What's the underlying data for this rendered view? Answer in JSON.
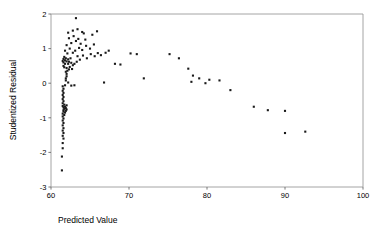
{
  "chart_data": {
    "type": "scatter",
    "title": "",
    "xlabel": "Predicted Value",
    "ylabel": "Studentized Residual",
    "xlim": [
      60,
      100
    ],
    "ylim": [
      -3,
      2
    ],
    "xticks": [
      60,
      70,
      80,
      90,
      100
    ],
    "xticklabels": [
      "60",
      "70",
      "80",
      "90",
      "100"
    ],
    "yticks": [
      -3,
      -2,
      -1,
      0,
      1,
      2
    ],
    "yticklabels": [
      "-3",
      "-2",
      "-1",
      "0",
      "1",
      "2"
    ],
    "grid": false,
    "legend": null,
    "marker": "filled-square",
    "marker_color": "#1a1a1a",
    "marker_size": 2.1,
    "n_points": 118,
    "points": [
      [
        61.4,
        -2.52
      ],
      [
        61.4,
        -2.12
      ],
      [
        61.5,
        -1.88
      ],
      [
        61.5,
        -1.73
      ],
      [
        61.6,
        -1.6
      ],
      [
        61.5,
        -1.52
      ],
      [
        61.6,
        -1.44
      ],
      [
        61.5,
        -1.37
      ],
      [
        61.6,
        -1.3
      ],
      [
        61.5,
        -1.22
      ],
      [
        61.6,
        -1.15
      ],
      [
        61.5,
        -1.08
      ],
      [
        61.6,
        -1.02
      ],
      [
        61.5,
        -0.96
      ],
      [
        61.7,
        -0.92
      ],
      [
        61.5,
        -0.88
      ],
      [
        61.8,
        -0.85
      ],
      [
        61.6,
        -0.82
      ],
      [
        61.9,
        -0.8
      ],
      [
        61.6,
        -0.78
      ],
      [
        62.0,
        -0.76
      ],
      [
        61.7,
        -0.74
      ],
      [
        61.9,
        -0.72
      ],
      [
        61.6,
        -0.7
      ],
      [
        61.8,
        -0.68
      ],
      [
        61.5,
        -0.66
      ],
      [
        62.0,
        -0.64
      ],
      [
        61.7,
        -0.62
      ],
      [
        61.5,
        -0.58
      ],
      [
        61.6,
        -0.52
      ],
      [
        61.5,
        -0.46
      ],
      [
        61.6,
        -0.4
      ],
      [
        61.5,
        -0.34
      ],
      [
        61.6,
        -0.28
      ],
      [
        61.5,
        -0.22
      ],
      [
        61.6,
        -0.16
      ],
      [
        61.5,
        -0.09
      ],
      [
        61.8,
        -0.06
      ],
      [
        62.6,
        -0.07
      ],
      [
        63.0,
        -0.06
      ],
      [
        62.2,
        0.02
      ],
      [
        61.9,
        0.08
      ],
      [
        61.9,
        0.14
      ],
      [
        62.0,
        0.2
      ],
      [
        62.0,
        0.27
      ],
      [
        61.9,
        0.33
      ],
      [
        62.1,
        0.36
      ],
      [
        62.3,
        0.4
      ],
      [
        62.0,
        0.44
      ],
      [
        61.7,
        0.46
      ],
      [
        61.6,
        0.5
      ],
      [
        62.4,
        0.47
      ],
      [
        62.7,
        0.41
      ],
      [
        62.8,
        0.52
      ],
      [
        62.2,
        0.56
      ],
      [
        61.8,
        0.56
      ],
      [
        61.6,
        0.6
      ],
      [
        61.5,
        0.64
      ],
      [
        61.8,
        0.66
      ],
      [
        62.0,
        0.63
      ],
      [
        62.3,
        0.62
      ],
      [
        62.6,
        0.59
      ],
      [
        63.0,
        0.56
      ],
      [
        63.3,
        0.62
      ],
      [
        61.6,
        0.7
      ],
      [
        61.9,
        0.72
      ],
      [
        62.2,
        0.69
      ],
      [
        61.7,
        0.76
      ],
      [
        62.5,
        0.72
      ],
      [
        63.4,
        0.78
      ],
      [
        63.7,
        0.68
      ],
      [
        64.1,
        0.8
      ],
      [
        64.6,
        0.72
      ],
      [
        65.1,
        0.84
      ],
      [
        65.6,
        0.78
      ],
      [
        66.0,
        0.87
      ],
      [
        66.4,
        0.81
      ],
      [
        62.1,
        0.86
      ],
      [
        62.8,
        0.88
      ],
      [
        63.1,
        0.94
      ],
      [
        61.8,
        0.94
      ],
      [
        62.4,
        1.0
      ],
      [
        63.6,
        1.02
      ],
      [
        64.0,
        0.96
      ],
      [
        64.5,
        1.08
      ],
      [
        65.0,
        1.0
      ],
      [
        65.5,
        1.12
      ],
      [
        62.0,
        1.1
      ],
      [
        62.6,
        1.16
      ],
      [
        63.2,
        1.22
      ],
      [
        63.8,
        1.14
      ],
      [
        64.4,
        1.26
      ],
      [
        62.3,
        1.3
      ],
      [
        62.9,
        1.36
      ],
      [
        63.5,
        1.28
      ],
      [
        64.2,
        1.44
      ],
      [
        65.3,
        1.4
      ],
      [
        62.2,
        1.46
      ],
      [
        62.8,
        1.52
      ],
      [
        63.4,
        1.56
      ],
      [
        64.0,
        1.48
      ],
      [
        65.9,
        1.5
      ],
      [
        63.2,
        1.88
      ],
      [
        67.0,
        0.88
      ],
      [
        67.4,
        0.94
      ],
      [
        68.2,
        0.56
      ],
      [
        68.9,
        0.54
      ],
      [
        70.2,
        0.86
      ],
      [
        71.0,
        0.84
      ],
      [
        66.8,
        0.02
      ],
      [
        71.9,
        0.14
      ],
      [
        75.2,
        0.84
      ],
      [
        76.4,
        0.72
      ],
      [
        77.6,
        0.42
      ],
      [
        78.2,
        0.22
      ],
      [
        78.0,
        0.04
      ],
      [
        79.0,
        0.14
      ],
      [
        79.8,
        0.0
      ],
      [
        80.3,
        0.1
      ],
      [
        81.6,
        0.08
      ],
      [
        83.0,
        -0.2
      ],
      [
        86.0,
        -0.68
      ],
      [
        87.8,
        -0.78
      ],
      [
        90.0,
        -0.8
      ],
      [
        90.0,
        -1.44
      ],
      [
        92.6,
        -1.4
      ]
    ]
  },
  "axes": {
    "x_axis_name": "x-axis",
    "y_axis_name": "y-axis"
  }
}
